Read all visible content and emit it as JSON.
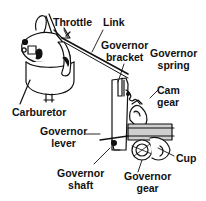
{
  "diagram": {
    "type": "labeled-mechanical-illustration",
    "labels": {
      "throttle": "Throttle",
      "link": "Link",
      "governor_bracket": [
        "Governor",
        "bracket"
      ],
      "governor_spring": [
        "Governor",
        "spring"
      ],
      "cam_gear": [
        "Cam",
        "gear"
      ],
      "carburetor": "Carburetor",
      "governor_lever": [
        "Governor",
        "lever"
      ],
      "cup": "Cup",
      "governor_shaft": [
        "Governor",
        "shaft"
      ],
      "governor_gear": [
        "Governor",
        "gear"
      ]
    },
    "colors": {
      "ink": "#111111",
      "background": "#ffffff",
      "shading": "#cfcfcf"
    }
  }
}
